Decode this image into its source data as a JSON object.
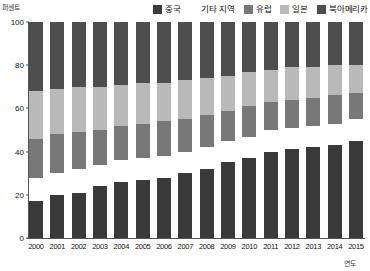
{
  "axes": {
    "y_title": "퍼센트",
    "x_title": "연도",
    "y_ticks": [
      "0",
      "20",
      "40",
      "60",
      "80",
      "100"
    ]
  },
  "legend": {
    "items": [
      {
        "label": "중국",
        "color": "#3a3a3a",
        "swatch": "legend-swatch-china"
      },
      {
        "label": "기타 지역",
        "color": "#ffffff",
        "swatch": "legend-swatch-other"
      },
      {
        "label": "유럽",
        "color": "#787878",
        "swatch": "legend-swatch-europe"
      },
      {
        "label": "일본",
        "color": "#b9b9b9",
        "swatch": "legend-swatch-japan"
      },
      {
        "label": "북아메리카",
        "color": "#4e4e4e",
        "swatch": "legend-swatch-north-america"
      }
    ]
  },
  "chart_data": {
    "type": "bar",
    "stacked": true,
    "title": "",
    "xlabel": "연도",
    "ylabel": "퍼센트",
    "ylim": [
      0,
      100
    ],
    "grid": false,
    "legend_position": "top-right",
    "categories": [
      "2000",
      "2001",
      "2002",
      "2003",
      "2004",
      "2005",
      "2006",
      "2007",
      "2008",
      "2009",
      "2010",
      "2011",
      "2012",
      "2013",
      "2014",
      "2015"
    ],
    "series": [
      {
        "name": "중국",
        "color": "#3a3a3a",
        "values": [
          17,
          20,
          21,
          24,
          26,
          27,
          28,
          30,
          32,
          35,
          37,
          40,
          41,
          42,
          43,
          45
        ]
      },
      {
        "name": "기타 지역",
        "color": "#ffffff",
        "values": [
          11,
          10,
          11,
          10,
          10,
          10,
          10,
          10,
          10,
          10,
          10,
          10,
          10,
          10,
          10,
          10
        ]
      },
      {
        "name": "유럽",
        "color": "#787878",
        "values": [
          18,
          18,
          17,
          16,
          16,
          16,
          16,
          15,
          15,
          14,
          14,
          13,
          13,
          13,
          13,
          12
        ]
      },
      {
        "name": "일본",
        "color": "#b9b9b9",
        "values": [
          22,
          21,
          21,
          20,
          19,
          19,
          18,
          18,
          17,
          16,
          16,
          15,
          15,
          14,
          14,
          13
        ]
      },
      {
        "name": "북아메리카",
        "color": "#4e4e4e",
        "values": [
          32,
          31,
          30,
          30,
          29,
          28,
          28,
          27,
          26,
          25,
          23,
          22,
          21,
          21,
          20,
          20
        ]
      }
    ]
  }
}
